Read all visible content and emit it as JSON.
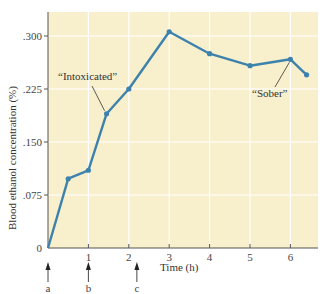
{
  "chart_data": {
    "type": "line",
    "title": "",
    "xlabel": "Time (h)",
    "ylabel": "Blood ethanol concentration (%)",
    "xlim": [
      0,
      6.7
    ],
    "ylim": [
      0,
      0.335
    ],
    "x_ticks": [
      1,
      2,
      3,
      4,
      5,
      6
    ],
    "x_tick_labels": [
      "1",
      "2",
      "3",
      "4",
      "5",
      "6"
    ],
    "y_ticks": [
      0,
      0.075,
      0.15,
      0.225,
      0.3
    ],
    "y_tick_labels": [
      "0",
      ".075",
      ".150",
      ".225",
      ".300"
    ],
    "grid": true,
    "background_color": "#f8efcc",
    "grid_color": "#ffffff",
    "line_color": "#3d82ad",
    "series": [
      {
        "name": "Blood ethanol concentration",
        "x": [
          0,
          0.5,
          1.0,
          1.45,
          2.0,
          3.0,
          4.0,
          5.0,
          6.0,
          6.4
        ],
        "y": [
          0,
          0.098,
          0.11,
          0.19,
          0.225,
          0.306,
          0.275,
          0.258,
          0.267,
          0.245
        ]
      }
    ],
    "annotations": [
      {
        "text": "“Intoxicated”",
        "points_to": {
          "x": 1.45,
          "y": 0.19
        }
      },
      {
        "text": "“Sober”",
        "points_to": {
          "x": 6.0,
          "y": 0.267
        }
      }
    ],
    "markers": [
      {
        "label": "a",
        "x": 0
      },
      {
        "label": "b",
        "x": 1
      },
      {
        "label": "c",
        "x": 2.2
      }
    ]
  }
}
